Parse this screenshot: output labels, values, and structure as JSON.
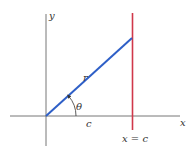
{
  "diagram": {
    "axes": {
      "x_label": "x",
      "y_label": "y",
      "axis_color": "#777777"
    },
    "segment_r": {
      "label": "r",
      "color": "#2e5fc7"
    },
    "angle": {
      "label": "θ"
    },
    "horizontal_distance": {
      "label": "c"
    },
    "vertical_line": {
      "label": "x = c",
      "color": "#d0384a"
    }
  }
}
